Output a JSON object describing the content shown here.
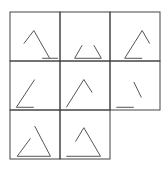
{
  "puzzle": {
    "grid": {
      "rows": 3,
      "cols": 3,
      "origin": [
        10,
        12
      ],
      "cell_w": 50,
      "cell_h": 49,
      "stroke": "#444444"
    },
    "cells": [
      {
        "row": 0,
        "col": 0,
        "lines": [
          [
            25,
            19,
            13,
            35
          ],
          [
            25,
            19,
            44,
            53
          ],
          [
            35,
            53,
            54,
            53
          ]
        ]
      },
      {
        "row": 0,
        "col": 1,
        "lines": [
          [
            23,
            37,
            14,
            53
          ],
          [
            14,
            53,
            46,
            53
          ],
          [
            37,
            37,
            46,
            53
          ]
        ]
      },
      {
        "row": 0,
        "col": 2,
        "lines": [
          [
            35,
            19,
            14,
            53
          ],
          [
            35,
            19,
            44,
            35
          ],
          [
            14,
            53,
            35,
            53
          ]
        ]
      },
      {
        "row": 1,
        "col": 0,
        "lines": [
          [
            26,
            19,
            4,
            53
          ],
          [
            4,
            53,
            25,
            53
          ]
        ]
      },
      {
        "row": 1,
        "col": 1,
        "lines": [
          [
            25,
            19,
            4,
            53
          ],
          [
            25,
            19,
            35,
            35
          ]
        ]
      },
      {
        "row": 1,
        "col": 2,
        "lines": [
          [
            25,
            22,
            34,
            41
          ],
          [
            4,
            53,
            25,
            53
          ]
        ]
      },
      {
        "row": 2,
        "col": 0,
        "lines": [
          [
            21,
            31,
            5,
            53
          ],
          [
            5,
            53,
            45,
            53
          ],
          [
            26,
            16,
            45,
            53
          ]
        ]
      },
      {
        "row": 2,
        "col": 1,
        "lines": [
          [
            25,
            18,
            15,
            35
          ],
          [
            25,
            18,
            45,
            53
          ],
          [
            4,
            53,
            45,
            53
          ]
        ]
      }
    ],
    "empty_cell": {
      "row": 2,
      "col": 2
    }
  }
}
